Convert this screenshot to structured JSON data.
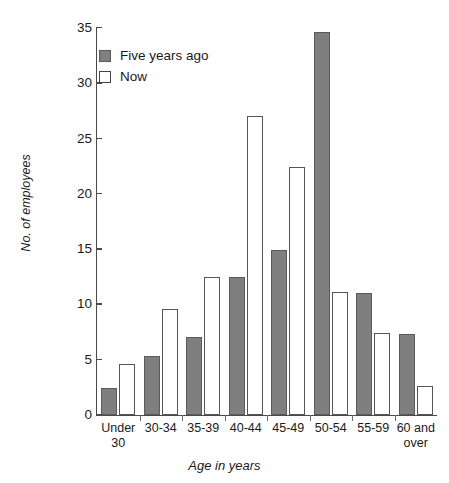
{
  "chart_data": {
    "type": "bar",
    "title": "",
    "xlabel": "Age in years",
    "ylabel": "No. of employees",
    "ylim": [
      0,
      35
    ],
    "ytick_step": 5,
    "yticks": [
      35,
      30,
      25,
      20,
      15,
      10,
      5,
      0
    ],
    "grid": false,
    "legend_position": "top-left",
    "categories": [
      "Under 30",
      "30-34",
      "35-39",
      "40-44",
      "45-49",
      "50-54",
      "55-59",
      "60 and over"
    ],
    "category_lines": [
      [
        "Under",
        "30"
      ],
      [
        "30-34"
      ],
      [
        "35-39"
      ],
      [
        "40-44"
      ],
      [
        "45-49"
      ],
      [
        "50-54"
      ],
      [
        "55-59"
      ],
      [
        "60 and",
        "over"
      ]
    ],
    "series": [
      {
        "name": "Five years ago",
        "color": "#7f7f7f",
        "values": [
          2.4,
          5.3,
          7.1,
          12.5,
          14.9,
          34.6,
          11.0,
          7.3
        ]
      },
      {
        "name": "Now",
        "color": "#ffffff",
        "values": [
          4.6,
          9.6,
          12.5,
          27.0,
          22.4,
          11.1,
          7.4,
          2.6
        ]
      }
    ]
  },
  "legend": {
    "items": [
      {
        "label": "Five years ago",
        "swatch": "filled-gray"
      },
      {
        "label": "Now",
        "swatch": "outline-white"
      }
    ]
  },
  "axes": {
    "y_title": "No. of employees",
    "x_title": "Age in years"
  },
  "colors": {
    "bar_five_years_ago": "#7f7f7f",
    "bar_now": "#ffffff",
    "bar_outline": "#555555",
    "axis": "#4a4a4a",
    "text": "#1a1a1a",
    "background": "#ffffff"
  }
}
